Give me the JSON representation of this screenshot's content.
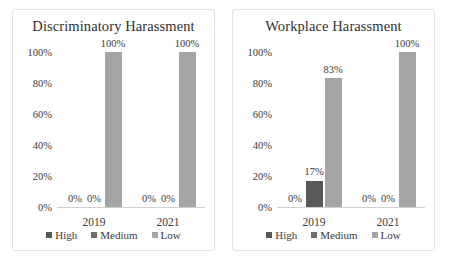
{
  "chart_data": [
    {
      "type": "bar",
      "title": "Discriminatory Harassment",
      "xlabel": "",
      "ylabel": "",
      "categories": [
        "2019",
        "2021"
      ],
      "series": [
        {
          "name": "High",
          "color": "#323232",
          "values": [
            0,
            0
          ],
          "labels": [
            "0%",
            "0%"
          ]
        },
        {
          "name": "Medium",
          "color": "#595959",
          "values": [
            0,
            0
          ],
          "labels": [
            "0%",
            "0%"
          ]
        },
        {
          "name": "Low",
          "color": "#a5a5a5",
          "values": [
            100,
            100
          ],
          "labels": [
            "100%",
            "100%"
          ]
        }
      ],
      "ylim": [
        0,
        100
      ],
      "yticks": [
        "0%",
        "20%",
        "40%",
        "60%",
        "80%",
        "100%"
      ],
      "ytick_values": [
        0,
        20,
        40,
        60,
        80,
        100
      ],
      "grid": false,
      "legend_position": "bottom"
    },
    {
      "type": "bar",
      "title": "Workplace Harassment",
      "xlabel": "",
      "ylabel": "",
      "categories": [
        "2019",
        "2021"
      ],
      "series": [
        {
          "name": "High",
          "color": "#323232",
          "values": [
            0,
            0
          ],
          "labels": [
            "0%",
            "0%"
          ]
        },
        {
          "name": "Medium",
          "color": "#595959",
          "values": [
            17,
            0
          ],
          "labels": [
            "17%",
            "0%"
          ]
        },
        {
          "name": "Low",
          "color": "#a5a5a5",
          "values": [
            83,
            100
          ],
          "labels": [
            "83%",
            "100%"
          ]
        }
      ],
      "ylim": [
        0,
        100
      ],
      "yticks": [
        "0%",
        "20%",
        "40%",
        "60%",
        "80%",
        "100%"
      ],
      "ytick_values": [
        0,
        20,
        40,
        60,
        80,
        100
      ],
      "grid": false,
      "legend_position": "bottom"
    }
  ],
  "panels": [
    {
      "title": "Discriminatory Harassment",
      "yticks": [
        "0%",
        "20%",
        "40%",
        "60%",
        "80%",
        "100%"
      ],
      "groups": [
        {
          "label": "2019",
          "bars": [
            {
              "series": "High",
              "value": 0,
              "label": "0%",
              "show_label": true,
              "color": "#323232"
            },
            {
              "series": "Medium",
              "value": 0,
              "label": "0%",
              "show_label": true,
              "color": "#595959"
            },
            {
              "series": "Low",
              "value": 100,
              "label": "100%",
              "show_label": true,
              "color": "#a5a5a5"
            }
          ]
        },
        {
          "label": "2021",
          "bars": [
            {
              "series": "High",
              "value": 0,
              "label": "0%",
              "show_label": true,
              "color": "#323232"
            },
            {
              "series": "Medium",
              "value": 0,
              "label": "0%",
              "show_label": true,
              "color": "#595959"
            },
            {
              "series": "Low",
              "value": 100,
              "label": "100%",
              "show_label": true,
              "color": "#a5a5a5"
            }
          ]
        }
      ],
      "legend": [
        {
          "label": "High",
          "color": "#595959"
        },
        {
          "label": "Medium",
          "color": "#6e6e6e"
        },
        {
          "label": "Low",
          "color": "#a5a5a5"
        }
      ]
    },
    {
      "title": "Workplace Harassment",
      "yticks": [
        "0%",
        "20%",
        "40%",
        "60%",
        "80%",
        "100%"
      ],
      "groups": [
        {
          "label": "2019",
          "bars": [
            {
              "series": "High",
              "value": 0,
              "label": "0%",
              "show_label": true,
              "color": "#323232"
            },
            {
              "series": "Medium",
              "value": 17,
              "label": "17%",
              "show_label": true,
              "color": "#595959"
            },
            {
              "series": "Low",
              "value": 83,
              "label": "83%",
              "show_label": true,
              "color": "#a5a5a5"
            }
          ]
        },
        {
          "label": "2021",
          "bars": [
            {
              "series": "High",
              "value": 0,
              "label": "0%",
              "show_label": true,
              "color": "#323232"
            },
            {
              "series": "Medium",
              "value": 0,
              "label": "0%",
              "show_label": true,
              "color": "#595959"
            },
            {
              "series": "Low",
              "value": 100,
              "label": "100%",
              "show_label": true,
              "color": "#a5a5a5"
            }
          ]
        }
      ],
      "legend": [
        {
          "label": "High",
          "color": "#595959"
        },
        {
          "label": "Medium",
          "color": "#6e6e6e"
        },
        {
          "label": "Low",
          "color": "#a5a5a5"
        }
      ]
    }
  ]
}
